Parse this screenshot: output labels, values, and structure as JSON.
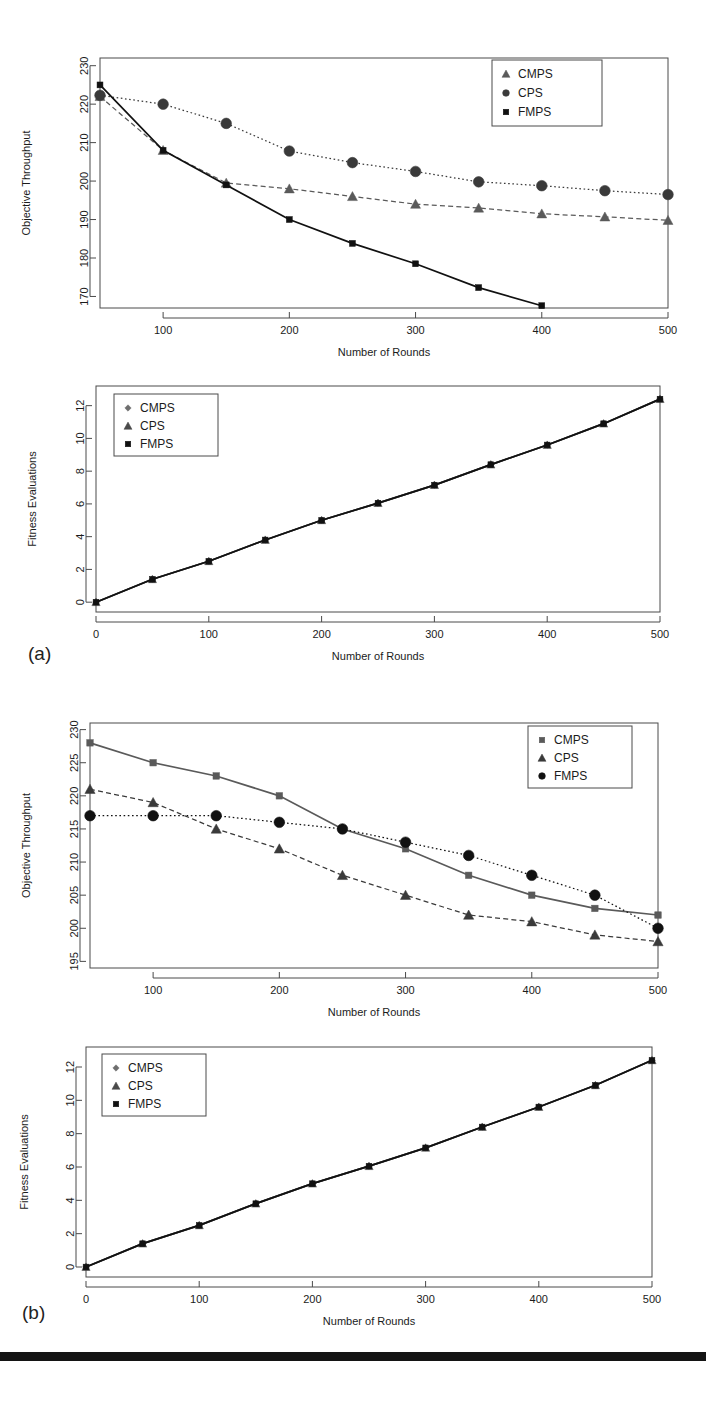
{
  "figure": {
    "panel_labels": [
      "(a)",
      "(b)"
    ],
    "bottom_bar_color": "#141414"
  },
  "charts": [
    {
      "id": "chart-a-throughput",
      "type": "line",
      "title": "",
      "xlabel": "Number of Rounds",
      "ylabel": "Objective Throughput",
      "xlim": [
        50,
        500
      ],
      "ylim": [
        167,
        232
      ],
      "xticks": [
        100,
        200,
        300,
        400,
        500
      ],
      "yticks": [
        170,
        180,
        190,
        200,
        210,
        220,
        230
      ],
      "grid": false,
      "legend_position": "top-right",
      "x": [
        50,
        100,
        150,
        200,
        250,
        300,
        350,
        400,
        450,
        500
      ],
      "series": [
        {
          "name": "CMPS",
          "marker": "triangle",
          "line": "dashed",
          "color": "#5a5a5a",
          "values": [
            222.0,
            208.0,
            199.5,
            198.0,
            196.0,
            194.0,
            193.0,
            191.5,
            190.7,
            189.8
          ]
        },
        {
          "name": "CPS",
          "marker": "circle",
          "line": "dotted",
          "color": "#3a3a3a",
          "values": [
            222.3,
            220.0,
            215.0,
            207.8,
            204.8,
            202.5,
            199.8,
            198.8,
            197.5,
            196.5
          ]
        },
        {
          "name": "FMPS",
          "marker": "square",
          "line": "solid",
          "color": "#111111",
          "values": [
            225.0,
            208.0,
            199.0,
            190.0,
            183.8,
            178.5,
            172.3,
            167.6,
            null,
            null
          ]
        }
      ]
    },
    {
      "id": "chart-a-fitness",
      "type": "line",
      "title": "",
      "xlabel": "Number of Rounds",
      "ylabel": "Fitness Evaluations",
      "xlim": [
        0,
        500
      ],
      "ylim": [
        -0.6,
        13.2
      ],
      "xticks": [
        0,
        100,
        200,
        300,
        400,
        500
      ],
      "yticks": [
        0,
        2,
        4,
        6,
        8,
        10,
        12
      ],
      "grid": false,
      "legend_position": "top-left",
      "x": [
        0,
        50,
        100,
        150,
        200,
        250,
        300,
        350,
        400,
        450,
        500
      ],
      "series": [
        {
          "name": "CMPS",
          "marker": "diamond",
          "line": "solid",
          "color": "#6e6e6e",
          "values": [
            0.0,
            1.4,
            2.5,
            3.8,
            5.0,
            6.05,
            7.15,
            8.4,
            9.6,
            10.9,
            12.4
          ]
        },
        {
          "name": "CPS",
          "marker": "triangle",
          "line": "solid",
          "color": "#4a4a4a",
          "values": [
            0.0,
            1.4,
            2.5,
            3.8,
            5.0,
            6.05,
            7.15,
            8.4,
            9.6,
            10.9,
            12.4
          ]
        },
        {
          "name": "FMPS",
          "marker": "square",
          "line": "solid",
          "color": "#111111",
          "values": [
            0.0,
            1.4,
            2.5,
            3.8,
            5.0,
            6.05,
            7.15,
            8.4,
            9.6,
            10.9,
            12.4
          ]
        }
      ]
    },
    {
      "id": "chart-b-throughput",
      "type": "line",
      "title": "",
      "xlabel": "Number of Rounds",
      "ylabel": "Objective Throughput",
      "xlim": [
        50,
        500
      ],
      "ylim": [
        194,
        231
      ],
      "xticks": [
        100,
        200,
        300,
        400,
        500
      ],
      "yticks": [
        195,
        200,
        205,
        210,
        215,
        220,
        225,
        230
      ],
      "grid": false,
      "legend_position": "top-right",
      "x": [
        50,
        100,
        150,
        200,
        250,
        300,
        350,
        400,
        450,
        500
      ],
      "series": [
        {
          "name": "CMPS",
          "marker": "square",
          "line": "solid",
          "color": "#5a5a5a",
          "values": [
            228.0,
            225.0,
            223.0,
            220.0,
            215.0,
            212.0,
            208.0,
            205.0,
            203.0,
            202.0
          ]
        },
        {
          "name": "CPS",
          "marker": "triangle",
          "line": "dashed",
          "color": "#3a3a3a",
          "values": [
            221.0,
            219.0,
            215.0,
            212.0,
            208.0,
            205.0,
            202.0,
            201.0,
            199.0,
            198.0
          ]
        },
        {
          "name": "FMPS",
          "marker": "circle",
          "line": "dotted",
          "color": "#111111",
          "values": [
            217.0,
            217.0,
            217.0,
            216.0,
            215.0,
            213.0,
            211.0,
            208.0,
            205.0,
            200.0
          ]
        }
      ]
    },
    {
      "id": "chart-b-fitness",
      "type": "line",
      "title": "",
      "xlabel": "Number of Rounds",
      "ylabel": "Fitness Evaluations",
      "xlim": [
        0,
        500
      ],
      "ylim": [
        -0.6,
        13.2
      ],
      "xticks": [
        0,
        100,
        200,
        300,
        400,
        500
      ],
      "yticks": [
        0,
        2,
        4,
        6,
        8,
        10,
        12
      ],
      "grid": false,
      "legend_position": "top-left",
      "x": [
        0,
        50,
        100,
        150,
        200,
        250,
        300,
        350,
        400,
        450,
        500
      ],
      "series": [
        {
          "name": "CMPS",
          "marker": "diamond",
          "line": "solid",
          "color": "#6e6e6e",
          "values": [
            0.0,
            1.4,
            2.5,
            3.8,
            5.0,
            6.05,
            7.15,
            8.4,
            9.6,
            10.9,
            12.4
          ]
        },
        {
          "name": "CPS",
          "marker": "triangle",
          "line": "solid",
          "color": "#4a4a4a",
          "values": [
            0.0,
            1.4,
            2.5,
            3.8,
            5.0,
            6.05,
            7.15,
            8.4,
            9.6,
            10.9,
            12.4
          ]
        },
        {
          "name": "FMPS",
          "marker": "square",
          "line": "solid",
          "color": "#111111",
          "values": [
            0.0,
            1.4,
            2.5,
            3.8,
            5.0,
            6.05,
            7.15,
            8.4,
            9.6,
            10.9,
            12.4
          ]
        }
      ]
    }
  ],
  "chart_data": {
    "type": "line",
    "panels": [
      {
        "panel": "(a)",
        "subplots": [
          {
            "ylabel": "Objective Throughput",
            "xlabel": "Number of Rounds",
            "xticks": [
              100,
              200,
              300,
              400,
              500
            ],
            "yticks": [
              170,
              180,
              190,
              200,
              210,
              220,
              230
            ],
            "x": [
              50,
              100,
              150,
              200,
              250,
              300,
              350,
              400,
              450,
              500
            ],
            "series": [
              {
                "name": "CMPS",
                "values": [
                  222.0,
                  208.0,
                  199.5,
                  198.0,
                  196.0,
                  194.0,
                  193.0,
                  191.5,
                  190.7,
                  189.8
                ]
              },
              {
                "name": "CPS",
                "values": [
                  222.3,
                  220.0,
                  215.0,
                  207.8,
                  204.8,
                  202.5,
                  199.8,
                  198.8,
                  197.5,
                  196.5
                ]
              },
              {
                "name": "FMPS",
                "values": [
                  225.0,
                  208.0,
                  199.0,
                  190.0,
                  183.8,
                  178.5,
                  172.3,
                  167.6,
                  null,
                  null
                ]
              }
            ]
          },
          {
            "ylabel": "Fitness Evaluations",
            "xlabel": "Number of Rounds",
            "xticks": [
              0,
              100,
              200,
              300,
              400,
              500
            ],
            "yticks": [
              0,
              2,
              4,
              6,
              8,
              10,
              12
            ],
            "x": [
              0,
              50,
              100,
              150,
              200,
              250,
              300,
              350,
              400,
              450,
              500
            ],
            "series": [
              {
                "name": "CMPS",
                "values": [
                  0.0,
                  1.4,
                  2.5,
                  3.8,
                  5.0,
                  6.05,
                  7.15,
                  8.4,
                  9.6,
                  10.9,
                  12.4
                ]
              },
              {
                "name": "CPS",
                "values": [
                  0.0,
                  1.4,
                  2.5,
                  3.8,
                  5.0,
                  6.05,
                  7.15,
                  8.4,
                  9.6,
                  10.9,
                  12.4
                ]
              },
              {
                "name": "FMPS",
                "values": [
                  0.0,
                  1.4,
                  2.5,
                  3.8,
                  5.0,
                  6.05,
                  7.15,
                  8.4,
                  9.6,
                  10.9,
                  12.4
                ]
              }
            ]
          }
        ]
      },
      {
        "panel": "(b)",
        "subplots": [
          {
            "ylabel": "Objective Throughput",
            "xlabel": "Number of Rounds",
            "xticks": [
              100,
              200,
              300,
              400,
              500
            ],
            "yticks": [
              195,
              200,
              205,
              210,
              215,
              220,
              225,
              230
            ],
            "x": [
              50,
              100,
              150,
              200,
              250,
              300,
              350,
              400,
              450,
              500
            ],
            "series": [
              {
                "name": "CMPS",
                "values": [
                  228.0,
                  225.0,
                  223.0,
                  220.0,
                  215.0,
                  212.0,
                  208.0,
                  205.0,
                  203.0,
                  202.0
                ]
              },
              {
                "name": "CPS",
                "values": [
                  221.0,
                  219.0,
                  215.0,
                  212.0,
                  208.0,
                  205.0,
                  202.0,
                  201.0,
                  199.0,
                  198.0
                ]
              },
              {
                "name": "FMPS",
                "values": [
                  217.0,
                  217.0,
                  217.0,
                  216.0,
                  215.0,
                  213.0,
                  211.0,
                  208.0,
                  205.0,
                  200.0
                ]
              }
            ]
          },
          {
            "ylabel": "Fitness Evaluations",
            "xlabel": "Number of Rounds",
            "xticks": [
              0,
              100,
              200,
              300,
              400,
              500
            ],
            "yticks": [
              0,
              2,
              4,
              6,
              8,
              10,
              12
            ],
            "x": [
              0,
              50,
              100,
              150,
              200,
              250,
              300,
              350,
              400,
              450,
              500
            ],
            "series": [
              {
                "name": "CMPS",
                "values": [
                  0.0,
                  1.4,
                  2.5,
                  3.8,
                  5.0,
                  6.05,
                  7.15,
                  8.4,
                  9.6,
                  10.9,
                  12.4
                ]
              },
              {
                "name": "CPS",
                "values": [
                  0.0,
                  1.4,
                  2.5,
                  3.8,
                  5.0,
                  6.05,
                  7.15,
                  8.4,
                  9.6,
                  10.9,
                  12.4
                ]
              },
              {
                "name": "FMPS",
                "values": [
                  0.0,
                  1.4,
                  2.5,
                  3.8,
                  5.0,
                  6.05,
                  7.15,
                  8.4,
                  9.6,
                  10.9,
                  12.4
                ]
              }
            ]
          }
        ]
      }
    ]
  }
}
